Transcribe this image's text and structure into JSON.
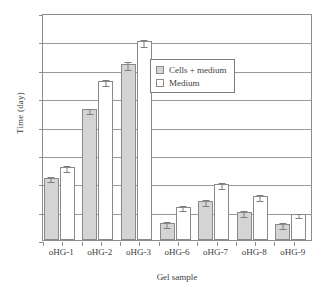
{
  "chart_data": {
    "type": "bar",
    "title": "",
    "xlabel": "Gel sample",
    "ylabel": "Time (day)",
    "ylim": [
      0,
      40
    ],
    "yticks": [
      0,
      5,
      10,
      15,
      20,
      25,
      30,
      35,
      40
    ],
    "grid": true,
    "legend_position": "inside-upper-right",
    "categories": [
      "oHG-1",
      "oHG-2",
      "oHG-3",
      "oHG-6",
      "oHG-7",
      "oHG-8",
      "oHG-9"
    ],
    "series": [
      {
        "name": "Cells + medium",
        "color": "#d4d4d4",
        "values": [
          11.0,
          23.0,
          31.0,
          3.0,
          6.9,
          4.9,
          2.8
        ],
        "errors": [
          0.5,
          0.5,
          0.7,
          0.5,
          0.5,
          0.5,
          0.5
        ]
      },
      {
        "name": "Medium",
        "color": "#ffffff",
        "values": [
          12.9,
          28.0,
          35.0,
          5.9,
          9.9,
          7.7,
          4.6
        ],
        "errors": [
          0.5,
          0.5,
          0.6,
          0.5,
          0.5,
          0.5,
          0.4
        ]
      }
    ]
  },
  "legend": {
    "items": [
      {
        "label": "Cells + medium",
        "swatch": "cells"
      },
      {
        "label": "Medium",
        "swatch": "medium"
      }
    ]
  },
  "axes": {
    "y_title": "Time (day)",
    "x_title": "Gel sample"
  }
}
